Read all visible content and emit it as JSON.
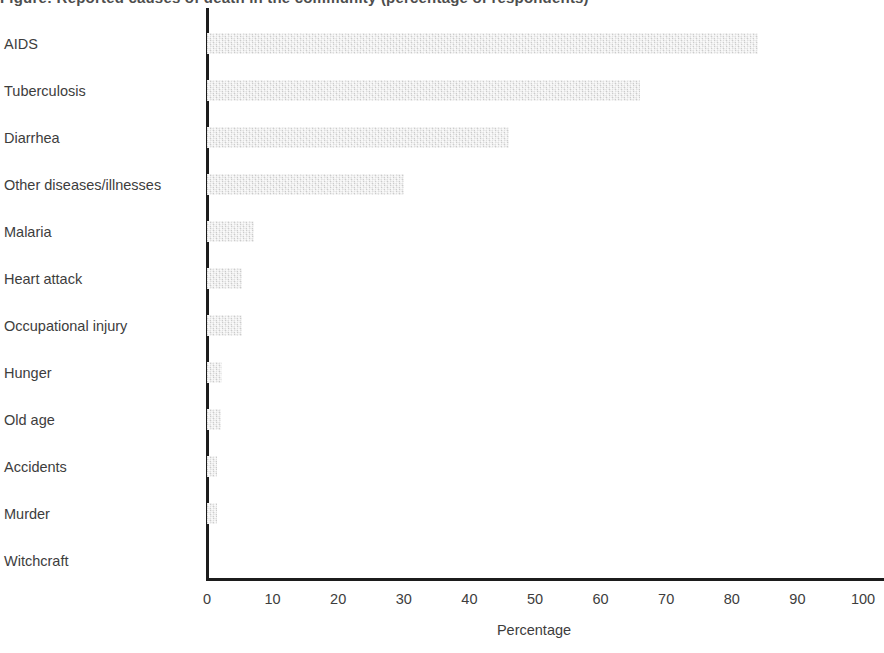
{
  "figure": {
    "clipped_title": "Figure: Reported causes of death in the community (percentage of respondents)"
  },
  "axis": {
    "x_title": "Percentage",
    "x_ticks": [
      "0",
      "10",
      "20",
      "30",
      "40",
      "50",
      "60",
      "70",
      "80",
      "90",
      "100"
    ]
  },
  "style": {
    "bar_color": "#dcdcdc",
    "axis_color": "#1c1c1c",
    "text_color": "#3d3d3d",
    "background": "#ffffff"
  },
  "chart_data": {
    "type": "bar",
    "orientation": "horizontal",
    "title": "",
    "xlabel": "Percentage",
    "ylabel": "",
    "xlim": [
      0,
      100
    ],
    "xticks": [
      0,
      10,
      20,
      30,
      40,
      50,
      60,
      70,
      80,
      90,
      100
    ],
    "grid": false,
    "legend": "none",
    "categories": [
      "AIDS",
      "Tuberculosis",
      "Diarrhea",
      "Other diseases/illnesses",
      "Malaria",
      "Heart attack",
      "Occupational injury",
      "Hunger",
      "Old age",
      "Accidents",
      "Murder",
      "Witchcraft"
    ],
    "values": [
      84,
      66,
      46,
      30,
      7.2,
      5.3,
      5.3,
      2.3,
      2.1,
      1.5,
      1.5,
      0
    ]
  }
}
